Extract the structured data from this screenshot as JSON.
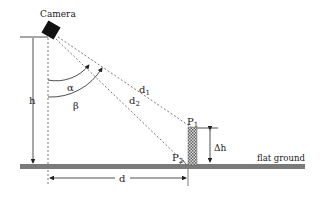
{
  "diagram": {
    "camera_label": "Camera",
    "height_label": "h",
    "angle_alpha_label": "α",
    "angle_beta_label": "β",
    "distance1_label": "d",
    "distance1_sub": "1",
    "distance2_label": "d",
    "distance2_sub": "2",
    "point1_label": "P",
    "point1_sub": "1",
    "point2_label": "P",
    "point2_sub": "2",
    "delta_h_label": "Δh",
    "ground_label": "flat ground",
    "horizontal_distance_label": "d"
  },
  "colors": {
    "line": "#222222",
    "dashed": "#555555",
    "ground": "#7a7a7a",
    "camera": "#111111"
  }
}
